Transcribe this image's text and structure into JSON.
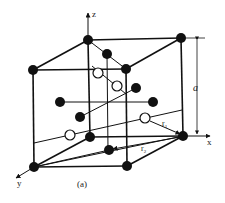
{
  "figure": {
    "caption": "(a)",
    "axes": {
      "x": "x",
      "y": "y",
      "z": "z"
    },
    "dimension_label": "a",
    "distance_labels": {
      "r1": "r",
      "r1_sub": "1",
      "r2": "r",
      "r2_sub": "2"
    }
  },
  "colors": {
    "stroke": "#111111",
    "atom_filled": "#111111",
    "atom_open": "#ffffff",
    "background": "#ffffff"
  },
  "cube": {
    "corners": [
      {
        "id": "back-top-left",
        "x": 88,
        "y": 40
      },
      {
        "id": "back-top-right",
        "x": 181,
        "y": 38
      },
      {
        "id": "front-top-left",
        "x": 33,
        "y": 70
      },
      {
        "id": "front-top-right",
        "x": 126,
        "y": 69
      },
      {
        "id": "back-bottom-left",
        "x": 90,
        "y": 137
      },
      {
        "id": "back-bottom-right",
        "x": 183,
        "y": 136
      },
      {
        "id": "front-bottom-left",
        "x": 34,
        "y": 167
      },
      {
        "id": "front-bottom-right",
        "x": 127,
        "y": 166
      }
    ]
  },
  "atoms": {
    "filled_interior": [
      {
        "x": 107,
        "y": 54
      },
      {
        "x": 136,
        "y": 88
      },
      {
        "x": 60,
        "y": 102
      },
      {
        "x": 153,
        "y": 102
      },
      {
        "x": 80,
        "y": 117
      },
      {
        "x": 109,
        "y": 150
      }
    ],
    "open_interstitial": [
      {
        "x": 98,
        "y": 73
      },
      {
        "x": 117,
        "y": 86
      },
      {
        "x": 145,
        "y": 118
      },
      {
        "x": 70,
        "y": 135
      }
    ]
  }
}
